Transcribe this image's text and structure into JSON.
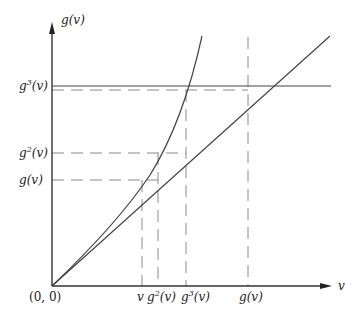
{
  "diagram": {
    "axes": {
      "y_label": "g(v)",
      "x_label": "v",
      "origin_label": "(0, 0)"
    },
    "y_ticks": [
      {
        "label": "g3(v)",
        "base": "g",
        "sup": "3",
        "rest": "(v)"
      },
      {
        "label": "g2(v)",
        "base": "g",
        "sup": "2",
        "rest": "(v)"
      },
      {
        "label": "g(v)",
        "base": "g",
        "sup": "",
        "rest": "(v)"
      }
    ],
    "x_ticks": [
      {
        "label": "v",
        "base": "v",
        "sup": "",
        "rest": ""
      },
      {
        "label": "g2(v)",
        "base": "g",
        "sup": "2",
        "rest": "(v)"
      },
      {
        "label": "g3(v)",
        "base": "g",
        "sup": "3",
        "rest": "(v)"
      },
      {
        "label": "g(v)",
        "base": "g",
        "sup": "",
        "rest": "(v)"
      }
    ],
    "curves": [
      {
        "name": "identity-line",
        "description": "straight line through origin"
      },
      {
        "name": "g-curve",
        "description": "convex curve through origin"
      }
    ],
    "colors": {
      "stroke": "#333333",
      "dashed": "#888888"
    }
  }
}
